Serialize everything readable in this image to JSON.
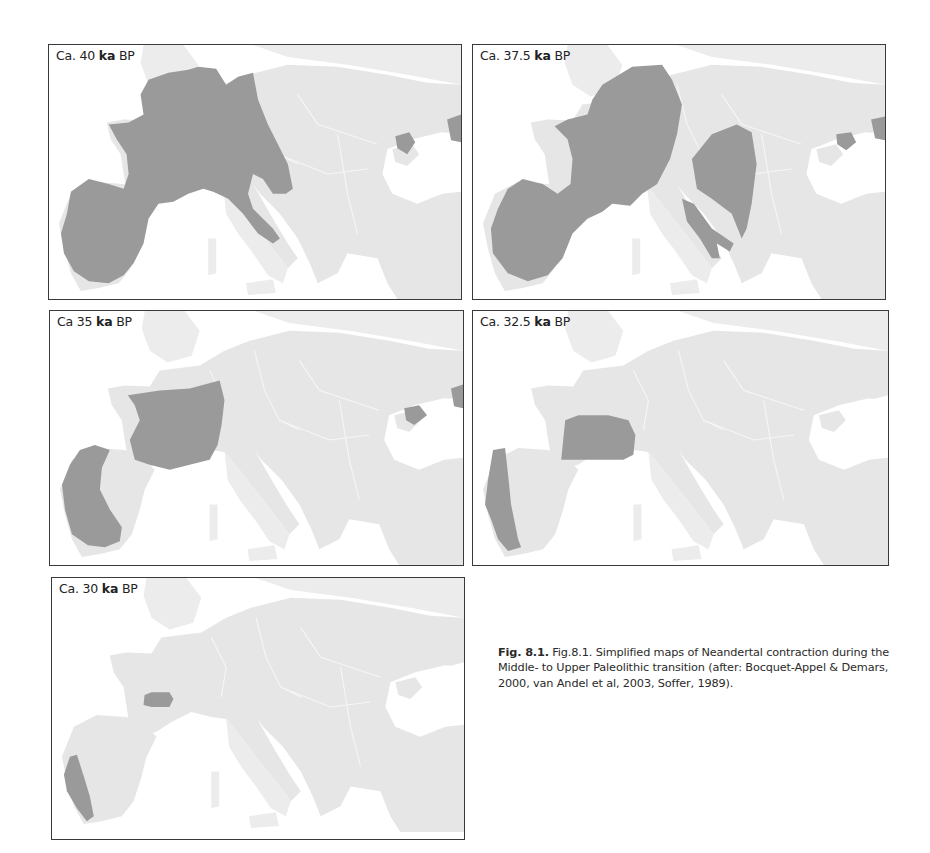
{
  "figure": {
    "panels": [
      {
        "label_prefix": "Ca. 40 ",
        "label_ka": "ka",
        "label_suffix": " BP",
        "age_ka": 40,
        "neandertal_range": "Iberia, France, Low Countries, western Germany, Switzerland, northern Italy and Italian peninsula, eastern Alpine region, Crimea"
      },
      {
        "label_prefix": "Ca. 37.5 ",
        "label_ka": "ka",
        "label_suffix": " BP",
        "age_ka": 37.5,
        "neandertal_range": "Iberia, France, western Germany, southern Italy, Balkan / Adriatic lobe, Crimea"
      },
      {
        "label_prefix": "Ca 35 ",
        "label_ka": "ka",
        "label_suffix": " BP",
        "age_ka": 35,
        "neandertal_range": "Western Iberia, France, Crimea"
      },
      {
        "label_prefix": "Ca. 32.5 ",
        "label_ka": "ka",
        "label_suffix": " BP",
        "age_ka": 32.5,
        "neandertal_range": "Portugal (western Iberia), south-west France"
      },
      {
        "label_prefix": "Ca. 30 ",
        "label_ka": "ka",
        "label_suffix": " BP",
        "age_ka": 30,
        "neandertal_range": "Southern Portugal, small pocket in south-west France"
      }
    ],
    "caption": {
      "number": "Fig. 8.1.",
      "text": " Fig.8.1. Simplified maps of Neandertal contraction during the Middle- to Upper Paleolithic transition (after: Bocquet-Appel & Demars, 2000, van Andel et al, 2003, Soffer, 1989)."
    },
    "colors": {
      "neandertal_area": "#9a9a9a",
      "land": "#e6e6e6",
      "sea": "#ffffff",
      "frame": "#3a3a3a"
    }
  }
}
